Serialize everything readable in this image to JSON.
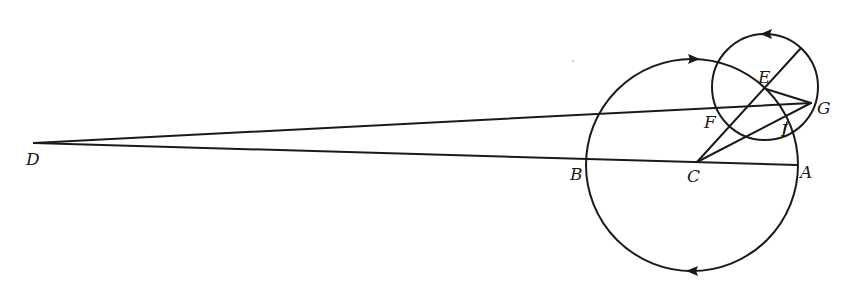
{
  "diagram": {
    "type": "geometry",
    "colors": {
      "ink": "#1a1a1a",
      "background": "#ffffff"
    },
    "points": {
      "A": {
        "label": "A",
        "x": 797,
        "y": 165
      },
      "B": {
        "label": "B",
        "x": 587,
        "y": 157
      },
      "C": {
        "label": "C",
        "x": 697,
        "y": 162
      },
      "D": {
        "label": "D",
        "x": 34,
        "y": 143
      },
      "E": {
        "label": "E",
        "x": 766,
        "y": 89
      },
      "F": {
        "label": "F",
        "x": 715,
        "y": 115
      },
      "G": {
        "label": "G",
        "x": 811,
        "y": 103
      },
      "I": {
        "label": "I",
        "x": 787,
        "y": 128
      }
    },
    "circles": [
      {
        "name": "deferent",
        "center": "C",
        "cx": 692,
        "cy": 165,
        "r": 106,
        "arrows": [
          "top: pointing right",
          "bottom: pointing left"
        ]
      },
      {
        "name": "epicycle",
        "center": "E",
        "cx": 765,
        "cy": 86,
        "r": 53,
        "arrows": [
          "top: pointing left"
        ]
      }
    ],
    "segments": [
      [
        "D",
        "G"
      ],
      [
        "D",
        "A"
      ],
      [
        "C",
        "G"
      ],
      [
        "E",
        "G"
      ],
      [
        "C",
        "E-extended"
      ],
      [
        "B",
        "A"
      ]
    ]
  }
}
